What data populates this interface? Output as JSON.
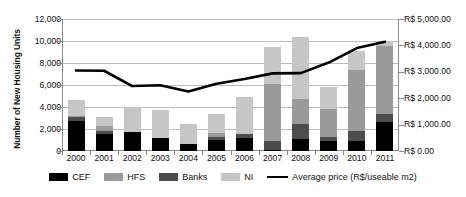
{
  "chart_data": {
    "type": "bar",
    "title": "",
    "subtitle": "",
    "xlabel": "",
    "ylabel": "Number of New Housing Units",
    "y2label": "",
    "categories": [
      "2000",
      "2001",
      "2002",
      "2003",
      "2004",
      "2005",
      "2006",
      "2007",
      "2008",
      "2009",
      "2010",
      "2011"
    ],
    "ylim": [
      0,
      12000
    ],
    "yticks": [
      0,
      2000,
      4000,
      6000,
      8000,
      10000,
      12000
    ],
    "ytick_labels": [
      "0",
      "2,000",
      "4,000",
      "6,000",
      "8,000",
      "10,000",
      "12,000"
    ],
    "y2lim": [
      0,
      5000
    ],
    "y2ticks": [
      0,
      1000,
      2000,
      3000,
      4000,
      5000
    ],
    "y2tick_labels": [
      "R$ 0.00",
      "R$ 1,000.00",
      "R$ 2,000.00",
      "R$ 3,000.00",
      "R$ 4,000.00",
      "R$ 5,000.00"
    ],
    "grid": true,
    "stacked": true,
    "legend_position": "bottom",
    "series": [
      {
        "name": "CEF",
        "type": "bar",
        "color": "#000000",
        "axis": "left",
        "values": [
          2700,
          1550,
          1700,
          1150,
          650,
          1000,
          1200,
          100,
          1100,
          900,
          950,
          2650
        ]
      },
      {
        "name": "HFS",
        "type": "bar",
        "color": "#9a9a9a",
        "axis": "left",
        "values": [
          150,
          450,
          0,
          0,
          0,
          350,
          0,
          5150,
          2250,
          2600,
          5550,
          6200
        ]
      },
      {
        "name": "Banks",
        "type": "bar",
        "color": "#4d4d4d",
        "axis": "left",
        "values": [
          350,
          250,
          0,
          0,
          0,
          250,
          350,
          800,
          1400,
          350,
          900,
          700
        ]
      },
      {
        "name": "NI",
        "type": "bar",
        "color": "#c6c6c6",
        "axis": "left",
        "values": [
          1400,
          800,
          2300,
          2550,
          1800,
          1750,
          3400,
          3400,
          5600,
          2000,
          1650,
          400
        ]
      },
      {
        "name": "Average price (R$/useable m2)",
        "type": "line",
        "color": "#000000",
        "axis": "right",
        "values": [
          3050,
          3040,
          2460,
          2490,
          2250,
          2550,
          2730,
          2940,
          2950,
          3350,
          3900,
          4140
        ]
      }
    ]
  },
  "legend": {
    "items": [
      {
        "label": "CEF",
        "color": "#000000",
        "marker": "square"
      },
      {
        "label": "HFS",
        "color": "#9a9a9a",
        "marker": "square"
      },
      {
        "label": "Banks",
        "color": "#4d4d4d",
        "marker": "square"
      },
      {
        "label": "NI",
        "color": "#c6c6c6",
        "marker": "square"
      },
      {
        "label": "Average price (R$/useable m2)",
        "color": "#000000",
        "marker": "line"
      }
    ]
  },
  "axes": {
    "y_title": "Number of New Housing Units"
  }
}
